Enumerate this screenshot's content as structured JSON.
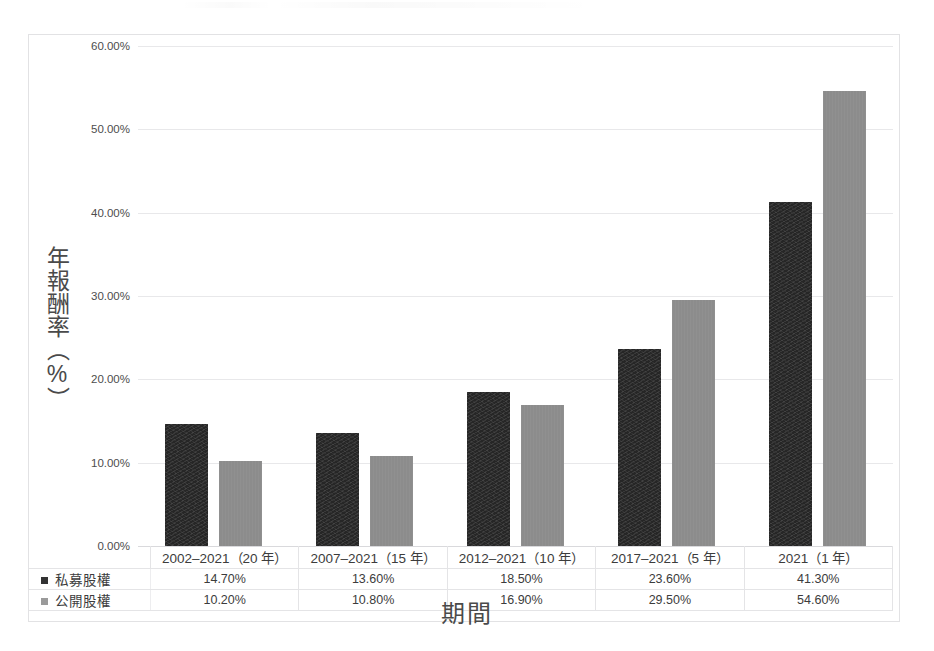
{
  "chart_data": {
    "type": "bar",
    "title": "",
    "xlabel": "期間",
    "ylabel": "年報酬率（%）",
    "ylim": [
      0,
      60
    ],
    "grid": true,
    "legend_position": "bottom-table",
    "categories": [
      "2002–2021（20 年）",
      "2007–2021（15 年）",
      "2012–2021（10 年）",
      "2017–2021（5 年）",
      "2021（1 年）"
    ],
    "yticks": [
      "0.00%",
      "10.00%",
      "20.00%",
      "30.00%",
      "40.00%",
      "50.00%",
      "60.00%"
    ],
    "ytick_values": [
      0,
      10,
      20,
      30,
      40,
      50,
      60
    ],
    "series": [
      {
        "name": "私募股權",
        "color": "#262626",
        "swatch": "swatch-pe",
        "values": [
          14.7,
          13.6,
          18.5,
          23.6,
          41.3
        ],
        "labels": [
          "14.70%",
          "13.60%",
          "18.50%",
          "23.60%",
          "41.30%"
        ]
      },
      {
        "name": "公開股權",
        "color": "#8c8c8c",
        "swatch": "swatch-pub",
        "values": [
          10.2,
          10.8,
          16.9,
          29.5,
          54.6
        ],
        "labels": [
          "10.20%",
          "10.80%",
          "16.90%",
          "29.50%",
          "54.60%"
        ]
      }
    ]
  },
  "colors": {
    "private_equity": "#262626",
    "public_equity": "#8c8c8c",
    "gridline": "#e8e8ea",
    "frame": "#e2e2e4",
    "text": "#3f3f3f",
    "background": "#ffffff"
  }
}
